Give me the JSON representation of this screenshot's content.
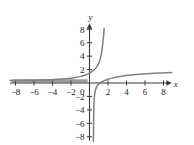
{
  "chart_data": {
    "type": "line",
    "title": "",
    "subtitle": "",
    "xlabel": "x",
    "ylabel": "y",
    "xlim": [
      -8.6,
      8.9
    ],
    "ylim": [
      -8.6,
      8.9
    ],
    "grid": false,
    "legend": null,
    "x_ticks": [
      -8,
      -6,
      -4,
      -2,
      0,
      2,
      4,
      6,
      8
    ],
    "x_tick_labels": [
      "−8",
      "−6",
      "−4",
      "−2",
      "0",
      "2",
      "4",
      "6",
      "8"
    ],
    "y_ticks": [
      -8,
      -6,
      -4,
      -2,
      2,
      4,
      6,
      8
    ],
    "y_tick_labels": [
      "−8",
      "−6",
      "−4",
      "−2",
      "2",
      "4",
      "6",
      "8"
    ],
    "origin_label": "0",
    "asymptotes": {
      "vertical_x": 0.35,
      "horizontal_y": 0.3
    },
    "series": [
      {
        "name": "upper-left-branch",
        "comment": "steep increasing branch rising to y=8 near x=1.5",
        "points": [
          [
            -8.6,
            0.38
          ],
          [
            -7.0,
            0.4
          ],
          [
            -6.0,
            0.42
          ],
          [
            -5.0,
            0.45
          ],
          [
            -4.0,
            0.5
          ],
          [
            -3.0,
            0.58
          ],
          [
            -2.0,
            0.72
          ],
          [
            -1.4,
            0.85
          ],
          [
            -1.0,
            0.98
          ],
          [
            -0.6,
            1.12
          ],
          [
            -0.3,
            1.28
          ],
          [
            0.0,
            1.45
          ],
          [
            0.25,
            1.68
          ],
          [
            0.5,
            1.95
          ],
          [
            0.7,
            2.25
          ],
          [
            0.9,
            2.65
          ],
          [
            1.05,
            3.1
          ],
          [
            1.18,
            3.7
          ],
          [
            1.28,
            4.35
          ],
          [
            1.36,
            5.05
          ],
          [
            1.43,
            5.8
          ],
          [
            1.49,
            6.6
          ],
          [
            1.54,
            7.35
          ],
          [
            1.58,
            8.1
          ]
        ]
      },
      {
        "name": "lower-right-branch",
        "comment": "branch rising from below the axis near x=0.4 toward y=1.5 at x=8.9",
        "points": [
          [
            0.42,
            -8.7
          ],
          [
            0.44,
            -6.5
          ],
          [
            0.46,
            -4.5
          ],
          [
            0.49,
            -3.0
          ],
          [
            0.53,
            -2.0
          ],
          [
            0.6,
            -1.3
          ],
          [
            0.7,
            -0.8
          ],
          [
            0.85,
            -0.4
          ],
          [
            1.05,
            -0.1
          ],
          [
            1.3,
            0.15
          ],
          [
            1.6,
            0.36
          ],
          [
            2.0,
            0.57
          ],
          [
            2.5,
            0.76
          ],
          [
            3.0,
            0.9
          ],
          [
            3.6,
            1.03
          ],
          [
            4.2,
            1.14
          ],
          [
            5.0,
            1.25
          ],
          [
            5.8,
            1.34
          ],
          [
            6.6,
            1.41
          ],
          [
            7.4,
            1.47
          ],
          [
            8.2,
            1.52
          ],
          [
            8.9,
            1.56
          ]
        ]
      }
    ],
    "highlight_segment": {
      "name": "horizontal-asymptote-shading",
      "comment": "thick gray band just above the x-axis on the left side",
      "y": 0.33,
      "x_start": -8.4,
      "x_end": -0.2
    },
    "colors": {
      "curve": "#808080",
      "axis": "#3a3a3a",
      "text": "#231f20",
      "highlight": "#9a9a9a",
      "background": "#ffffff"
    }
  },
  "axes": {
    "x_axis_name": "x",
    "y_axis_name": "y"
  }
}
